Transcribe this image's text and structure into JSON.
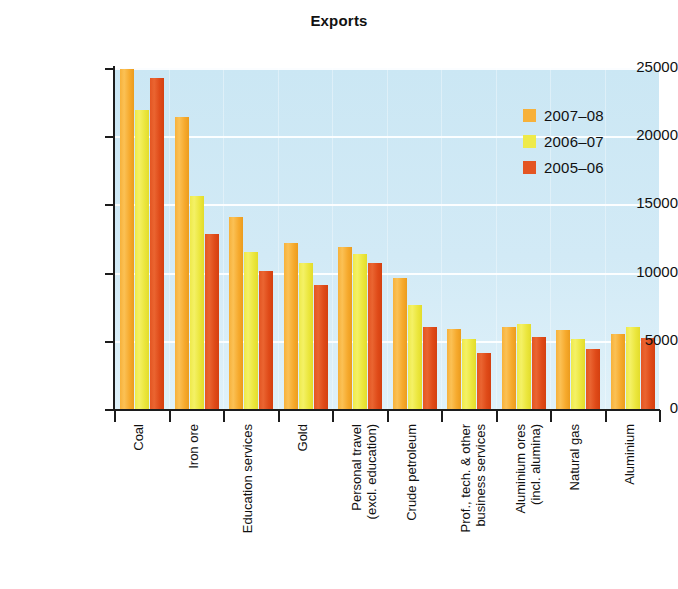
{
  "chart_data": {
    "type": "bar",
    "title": "Exports",
    "xlabel": "",
    "ylabel": "A$ million",
    "ylim": [
      0,
      25000
    ],
    "yticks": [
      0,
      5000,
      10000,
      15000,
      20000,
      25000
    ],
    "ytick_labels": [
      "0",
      "5000",
      "10000",
      "15000",
      "20000",
      "25000"
    ],
    "grid": true,
    "legend_position": "top-right",
    "categories": [
      {
        "line1": "Coal",
        "line2": ""
      },
      {
        "line1": "Iron ore",
        "line2": ""
      },
      {
        "line1": "Education services",
        "line2": ""
      },
      {
        "line1": "Gold",
        "line2": ""
      },
      {
        "line1": "Personal travel",
        "line2": "(excl. education)"
      },
      {
        "line1": "Crude petroleum",
        "line2": ""
      },
      {
        "line1": "Prof., tech. & other",
        "line2": "business services"
      },
      {
        "line1": "Aluminium ores",
        "line2": "(incl. alumina)"
      },
      {
        "line1": "Natural gas",
        "line2": ""
      },
      {
        "line1": "Aluminium",
        "line2": ""
      }
    ],
    "series": [
      {
        "name": "2007-08",
        "label": "2007–08",
        "color": "#f7b13a",
        "values": [
          24950,
          21400,
          14100,
          12200,
          11900,
          9600,
          5900,
          6000,
          5800,
          5500
        ]
      },
      {
        "name": "2006-07",
        "label": "2006–07",
        "color": "#eeea4a",
        "values": [
          21900,
          15600,
          11500,
          10700,
          11400,
          7600,
          5100,
          6200,
          5100,
          6000
        ]
      },
      {
        "name": "2005-06",
        "label": "2005–06",
        "color": "#e45522",
        "values": [
          24300,
          12800,
          10100,
          9100,
          10700,
          6000,
          4100,
          5300,
          4400,
          5200
        ]
      }
    ]
  }
}
